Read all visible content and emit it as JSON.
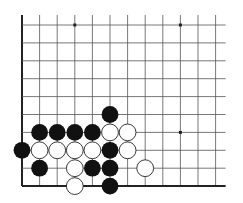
{
  "board": {
    "label": "Go problem diagram (lower-left corner)",
    "columns": 12,
    "rows": 10,
    "origin_x": 22,
    "origin_y": 25,
    "spacing_x": 17.6,
    "spacing_y": 17.9,
    "line_extend_top": 10,
    "line_extend_right": 10,
    "line_color": "#555555",
    "edge_color": "#222222",
    "star_points": [
      {
        "c": 3,
        "r": 0
      },
      {
        "c": 9,
        "r": 0
      },
      {
        "c": 9,
        "r": 6
      }
    ],
    "stones": [
      {
        "c": 5,
        "r": 5,
        "color": "black"
      },
      {
        "c": 1,
        "r": 6,
        "color": "black"
      },
      {
        "c": 2,
        "r": 6,
        "color": "black"
      },
      {
        "c": 3,
        "r": 6,
        "color": "black"
      },
      {
        "c": 4,
        "r": 6,
        "color": "black"
      },
      {
        "c": 5,
        "r": 6,
        "color": "white"
      },
      {
        "c": 6,
        "r": 6,
        "color": "white"
      },
      {
        "c": 0,
        "r": 7,
        "color": "black"
      },
      {
        "c": 1,
        "r": 7,
        "color": "white"
      },
      {
        "c": 2,
        "r": 7,
        "color": "white"
      },
      {
        "c": 3,
        "r": 7,
        "color": "white"
      },
      {
        "c": 4,
        "r": 7,
        "color": "white"
      },
      {
        "c": 5,
        "r": 7,
        "color": "black"
      },
      {
        "c": 6,
        "r": 7,
        "color": "white"
      },
      {
        "c": 1,
        "r": 8,
        "color": "black"
      },
      {
        "c": 3,
        "r": 8,
        "color": "white"
      },
      {
        "c": 4,
        "r": 8,
        "color": "black"
      },
      {
        "c": 5,
        "r": 8,
        "color": "black"
      },
      {
        "c": 7,
        "r": 8,
        "color": "white"
      },
      {
        "c": 3,
        "r": 9,
        "color": "white"
      },
      {
        "c": 5,
        "r": 9,
        "color": "black"
      }
    ],
    "colors": {
      "black_stone": "#111111",
      "white_stone": "#ffffff",
      "white_stroke": "#222222"
    }
  }
}
